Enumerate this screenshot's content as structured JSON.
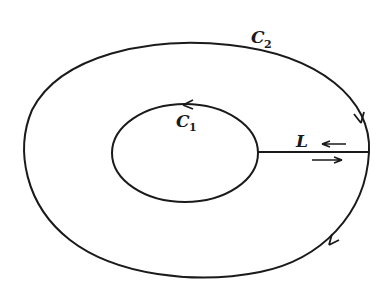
{
  "diagram": {
    "outer_contour": {
      "label": "C",
      "subscript": "2",
      "direction": "clockwise"
    },
    "inner_contour": {
      "label": "C",
      "subscript": "1",
      "direction": "counterclockwise"
    },
    "cut_line": {
      "label": "L"
    },
    "colors": {
      "stroke": "#1a1a1a",
      "background": "#ffffff"
    }
  }
}
